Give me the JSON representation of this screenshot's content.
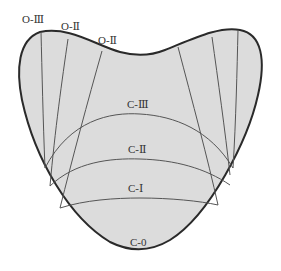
{
  "diagram": {
    "colors": {
      "fill": "#dcdcdc",
      "outline": "#2a2a2a",
      "inner_lines": "#555555",
      "background": "#ffffff"
    },
    "labels": {
      "o3": "O-Ⅲ",
      "o2": "O-Ⅱ",
      "o1": "O-Ⅱ",
      "c3": "C-Ⅲ",
      "c2": "C-Ⅱ",
      "c1": "C-Ⅰ",
      "c0": "C-0"
    }
  }
}
